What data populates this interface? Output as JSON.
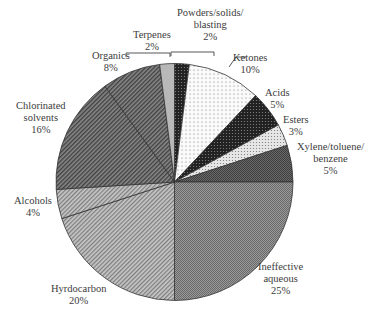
{
  "chart_data": {
    "type": "pie",
    "title": "",
    "start_angle_deg": 0,
    "direction": "clockwise",
    "slices": [
      {
        "label": "Powders/solids/blasting",
        "value": 2,
        "pct": "2%",
        "fill": "#2a2a2a",
        "pattern": "dots-dark"
      },
      {
        "label": "Ketones",
        "value": 10,
        "pct": "10%",
        "fill": "#f4f4f4",
        "pattern": "dots-light"
      },
      {
        "label": "Acids",
        "value": 5,
        "pct": "5%",
        "fill": "#2e2e2e",
        "pattern": "dots-dark"
      },
      {
        "label": "Esters",
        "value": 3,
        "pct": "3%",
        "fill": "#dcdcdc",
        "pattern": "dots-light"
      },
      {
        "label": "Xylene/toluene/benzene",
        "value": 5,
        "pct": "5%",
        "fill": "#5a5a5a",
        "pattern": "grid"
      },
      {
        "label": "Ineffective aqueous",
        "value": 25,
        "pct": "25%",
        "fill": "#8a8a8a",
        "pattern": "grid"
      },
      {
        "label": "Hyrdocarbon",
        "value": 20,
        "pct": "20%",
        "fill": "#b0b0b0",
        "pattern": "diag"
      },
      {
        "label": "Alcohols",
        "value": 4,
        "pct": "4%",
        "fill": "#bdbdbd",
        "pattern": "diag"
      },
      {
        "label": "Chlorinated solvents",
        "value": 16,
        "pct": "16%",
        "fill": "#6e6e6e",
        "pattern": "diag-dark"
      },
      {
        "label": "Organics",
        "value": 8,
        "pct": "8%",
        "fill": "#747474",
        "pattern": "diag-dark"
      },
      {
        "label": "Terpenes",
        "value": 2,
        "pct": "2%",
        "fill": "#b8b8b8",
        "pattern": "solid"
      }
    ],
    "legend": "none (direct labels)"
  },
  "labels": {
    "powders": {
      "l1": "Powders/solids/",
      "l2": "blasting",
      "l3": "2%"
    },
    "terpenes": {
      "l1": "Terpenes",
      "l2": "2%"
    },
    "organics": {
      "l1": "Organics",
      "l2": "8%"
    },
    "ketones": {
      "l1": "Ketones",
      "l2": "10%"
    },
    "acids": {
      "l1": "Acids",
      "l2": "5%"
    },
    "esters": {
      "l1": "Esters",
      "l2": "3%"
    },
    "xylene": {
      "l1": "Xylene/toluene/",
      "l2": "benzene",
      "l3": "5%"
    },
    "chlorinated": {
      "l1": "Chlorinated",
      "l2": "solvents",
      "l3": "16%"
    },
    "alcohols": {
      "l1": "Alcohols",
      "l2": "4%"
    },
    "hydrocarbon": {
      "l1": "Hyrdocarbon",
      "l2": "20%"
    },
    "aqueous": {
      "l1": "Ineffective",
      "l2": "aqueous",
      "l3": "25%"
    }
  }
}
